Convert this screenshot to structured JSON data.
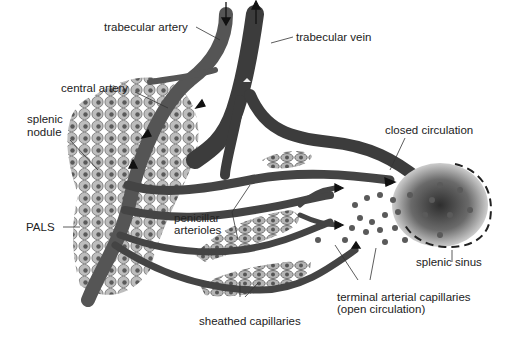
{
  "diagram": {
    "labels": {
      "trabecular_artery": "trabecular artery",
      "trabecular_vein": "trabecular vein",
      "central_artery": "central artery",
      "splenic_nodule_1": "splenic",
      "splenic_nodule_2": "nodule",
      "pals": "PALS",
      "closed_circulation": "closed circulation",
      "penicillar_1": "penicillar",
      "penicillar_2": "arterioles",
      "splenic_sinus": "splenic sinus",
      "terminal_1": "terminal arterial capillaries",
      "terminal_2": "(open circulation)",
      "sheathed_capillaries": "sheathed capillaries"
    },
    "colors": {
      "vessel": "#4a4a4a",
      "vessel_light": "#7a7a7a",
      "cell_fill": "#b8b8b8",
      "cell_nucleus": "#555555",
      "sinus_dark": "#3a3a3a",
      "text": "#222222"
    }
  }
}
